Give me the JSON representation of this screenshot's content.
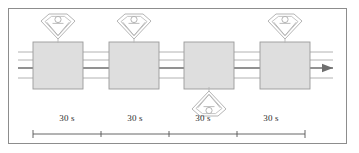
{
  "figure": {
    "background_color": "#ffffff",
    "frame_color": "#8d8d8d",
    "station_fill": "#dedede",
    "station_stroke": "#9a9a9a",
    "line_color": "#a9a9a9",
    "highlight_line_color": "#6e6e6e",
    "icon_stroke": "#b5b5b5",
    "scale_color": "#555555",
    "text_color": "#2b2b2b"
  },
  "stations": [
    {
      "id": "station-1",
      "x": 33,
      "y": 42,
      "width": 50,
      "height": 47,
      "operator": "above"
    },
    {
      "id": "station-2",
      "x": 109,
      "y": 42,
      "width": 50,
      "height": 47,
      "operator": "above"
    },
    {
      "id": "station-3",
      "x": 184,
      "y": 42,
      "width": 50,
      "height": 47,
      "operator": "below"
    },
    {
      "id": "station-4",
      "x": 260,
      "y": 42,
      "width": 50,
      "height": 47,
      "operator": "above"
    }
  ],
  "operators": [
    {
      "id": "operator-1",
      "cx": 58,
      "cy": 26,
      "orientation": "up",
      "icon": "operator-icon"
    },
    {
      "id": "operator-2",
      "cx": 134,
      "cy": 26,
      "orientation": "up",
      "icon": "operator-icon"
    },
    {
      "id": "operator-3",
      "cx": 209,
      "cy": 104,
      "orientation": "down",
      "icon": "operator-icon"
    },
    {
      "id": "operator-4",
      "cx": 285,
      "cy": 26,
      "orientation": "up",
      "icon": "operator-icon"
    }
  ],
  "conveyor": {
    "lines_y": [
      52,
      60,
      68,
      78
    ],
    "highlight_line_index": 2,
    "start_x": 18,
    "end_x": 333,
    "arrow": {
      "x": 333,
      "y": 68,
      "direction": "right"
    }
  },
  "scale": {
    "axis_y": 134,
    "start_x": 33,
    "end_x": 305,
    "tick_positions": [
      33,
      101,
      169,
      237,
      305
    ],
    "label_y": 113,
    "segments": [
      {
        "label": "30 s",
        "center_x": 67
      },
      {
        "label": "30 s",
        "center_x": 135
      },
      {
        "label": "30 s",
        "center_x": 203
      },
      {
        "label": "30 s",
        "center_x": 271
      }
    ]
  }
}
